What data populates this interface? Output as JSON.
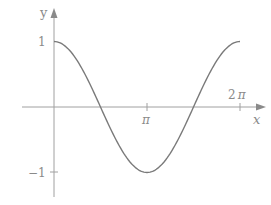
{
  "chart_data": {
    "type": "line",
    "title": "",
    "xlabel": "x",
    "ylabel": "y",
    "function": "y = cos(x)",
    "x_range": [
      0,
      6.2832
    ],
    "ylim": [
      -1,
      1
    ],
    "xticks": [
      {
        "value": 3.1416,
        "label": "π"
      },
      {
        "value": 6.2832,
        "label": "2π"
      }
    ],
    "yticks": [
      {
        "value": 1,
        "label": "1"
      },
      {
        "value": -1,
        "label": "−1"
      }
    ],
    "grid": false,
    "legend": null,
    "series": [
      {
        "name": "cos x",
        "x": [
          0,
          0.7854,
          1.5708,
          2.3562,
          3.1416,
          3.927,
          4.7124,
          5.4978,
          6.2832
        ],
        "values": [
          1,
          0.707,
          0,
          -0.707,
          -1,
          -0.707,
          0,
          0.707,
          1
        ]
      }
    ],
    "colors": {
      "axis": "#9a9a9a",
      "curve": "#7a7a7a",
      "text": "#8a8a8a"
    }
  },
  "labels": {
    "y_axis": "y",
    "x_axis": "x",
    "ytick_1": "1",
    "ytick_neg1": "−1",
    "xtick_pi": "π",
    "xtick_2pi_coef": "2",
    "xtick_2pi_pi": "π"
  }
}
